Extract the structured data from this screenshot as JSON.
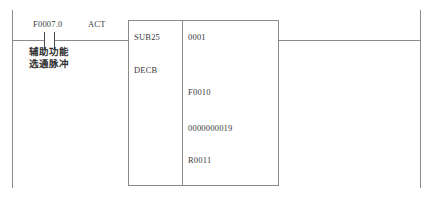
{
  "diagram": {
    "type": "plc-ladder-rung",
    "colors": {
      "rail": "#8a8a8a",
      "contact": "#4a4a4a",
      "text": "#3a3a3a",
      "background": "#ffffff"
    }
  },
  "contact": {
    "address": "F0007.0",
    "act_label": "ACT",
    "annotation_line1": "辅助功能",
    "annotation_line2": "选通脉冲"
  },
  "function_block": {
    "instruction": "SUB25",
    "mnemonic": "DECB",
    "parameters": [
      "0001",
      "F0010",
      "0000000019",
      "R0011"
    ]
  }
}
